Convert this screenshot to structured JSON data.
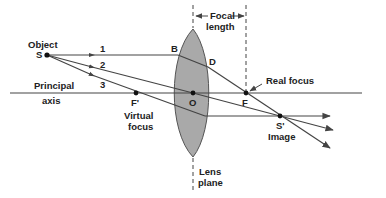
{
  "diagram": {
    "colors": {
      "line": "#444444",
      "lens_fill": "#a9a9a9",
      "lens_stroke": "#555555",
      "text": "#222222",
      "background": "#ffffff"
    },
    "labels": {
      "object": "Object",
      "object_point": "S",
      "ray1": "1",
      "ray2": "2",
      "ray3": "3",
      "principal": "Principal",
      "axis": "axis",
      "point_b": "B",
      "point_d": "D",
      "focal": "Focal",
      "length": "length",
      "real_focus": "Real focus",
      "point_f": "F",
      "point_f_prime": "F'",
      "virtual": "Virtual",
      "focus": "focus",
      "point_o": "O",
      "image_point": "S'",
      "image": "Image",
      "lens": "Lens",
      "plane": "plane"
    },
    "points": {
      "S": [
        47,
        55
      ],
      "O": [
        193,
        93
      ],
      "F": [
        246,
        93
      ],
      "F_prime": [
        136,
        93
      ],
      "B": [
        178,
        55
      ],
      "D": [
        208,
        67
      ],
      "S_prime": [
        280,
        116
      ]
    }
  }
}
